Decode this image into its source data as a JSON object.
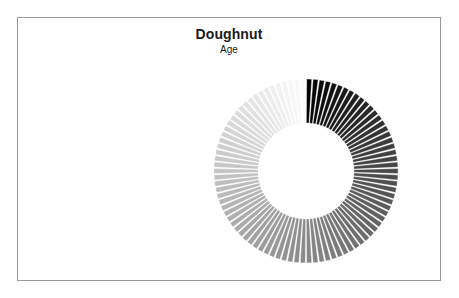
{
  "page": {
    "background_color": "#ffffff",
    "width": 459,
    "height": 298
  },
  "frame": {
    "border_color": "#9a9a9a",
    "fill_color": "#ffffff"
  },
  "header": {
    "title": "Doughnut",
    "subtitle": "Age"
  },
  "chart_data": {
    "type": "pie",
    "variant": "doughnut",
    "title": "Doughnut",
    "subtitle": "Age",
    "xlabel": "",
    "ylabel": "",
    "legend": false,
    "legend_position": "none",
    "grid": false,
    "category_field": "Age",
    "slice_count": 90,
    "equal_slices": true,
    "start_angle_deg": 0,
    "direction": "clockwise",
    "inner_radius_px": 48,
    "outer_radius_px": 92,
    "center_px": [
      230,
      170
    ],
    "slice_gap_deg": 0.9,
    "gap_color": "#ffffff",
    "color_scale": {
      "type": "sequential-grayscale",
      "from": "#000000",
      "to": "#fbfbfb",
      "description": "black at 12 o'clock fading clockwise to near-white"
    },
    "categories": [
      "1",
      "2",
      "3",
      "4",
      "5",
      "6",
      "7",
      "8",
      "9",
      "10",
      "11",
      "12",
      "13",
      "14",
      "15",
      "16",
      "17",
      "18",
      "19",
      "20",
      "21",
      "22",
      "23",
      "24",
      "25",
      "26",
      "27",
      "28",
      "29",
      "30",
      "31",
      "32",
      "33",
      "34",
      "35",
      "36",
      "37",
      "38",
      "39",
      "40",
      "41",
      "42",
      "43",
      "44",
      "45",
      "46",
      "47",
      "48",
      "49",
      "50",
      "51",
      "52",
      "53",
      "54",
      "55",
      "56",
      "57",
      "58",
      "59",
      "60",
      "61",
      "62",
      "63",
      "64",
      "65",
      "66",
      "67",
      "68",
      "69",
      "70",
      "71",
      "72",
      "73",
      "74",
      "75",
      "76",
      "77",
      "78",
      "79",
      "80",
      "81",
      "82",
      "83",
      "84",
      "85",
      "86",
      "87",
      "88",
      "89",
      "90"
    ],
    "values": [
      1,
      1,
      1,
      1,
      1,
      1,
      1,
      1,
      1,
      1,
      1,
      1,
      1,
      1,
      1,
      1,
      1,
      1,
      1,
      1,
      1,
      1,
      1,
      1,
      1,
      1,
      1,
      1,
      1,
      1,
      1,
      1,
      1,
      1,
      1,
      1,
      1,
      1,
      1,
      1,
      1,
      1,
      1,
      1,
      1,
      1,
      1,
      1,
      1,
      1,
      1,
      1,
      1,
      1,
      1,
      1,
      1,
      1,
      1,
      1,
      1,
      1,
      1,
      1,
      1,
      1,
      1,
      1,
      1,
      1,
      1,
      1,
      1,
      1,
      1,
      1,
      1,
      1,
      1,
      1,
      1,
      1,
      1,
      1,
      1,
      1,
      1,
      1,
      1,
      1
    ]
  }
}
